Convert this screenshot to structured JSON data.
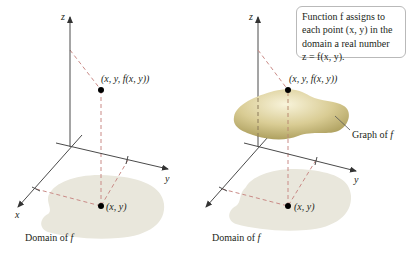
{
  "left_panel": {
    "axis_labels": {
      "z": "z",
      "y": "y",
      "x": "x"
    },
    "point_3d_label": "(x, y, f(x, y))",
    "point_2d_label": "(x, y)",
    "domain_label_text": "Domain of ",
    "domain_label_f": "f"
  },
  "right_panel": {
    "axis_labels": {
      "z": "z",
      "y": "y",
      "x": "x"
    },
    "point_3d_label": "(x, y, f(x, y))",
    "point_2d_label": "(x, y)",
    "domain_label_text": "Domain of ",
    "domain_label_f": "f",
    "graph_label_text": "Graph of ",
    "graph_label_f": "f",
    "callout": {
      "line1": "Function f assigns to",
      "line2": "each point (x, y) in the",
      "line3": "domain a real number",
      "line4": "z = f(x, y)."
    }
  },
  "colors": {
    "axis": "#4a4a4a",
    "dashed_guides": "#c98a86",
    "domain_fill": "#e9e7dc",
    "surface_light": "#f6f0d0",
    "surface_dark": "#b3a565",
    "point": "#000000",
    "callout_border": "#b9b9b9"
  }
}
